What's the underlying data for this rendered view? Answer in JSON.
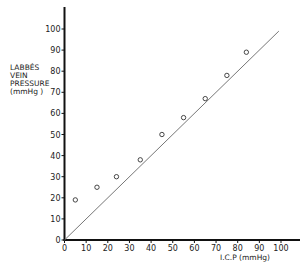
{
  "chart_data": {
    "type": "scatter",
    "title": "",
    "xlabel": "I.C.P (mmHg)",
    "ylabel": "LABBÉS VEIN PRESSURE (mmHg)",
    "ylabel_lines": [
      "LABBÉS",
      "VEIN",
      "PRESSURE",
      "(mmHg )"
    ],
    "xlim": [
      0,
      100
    ],
    "ylim": [
      0,
      100
    ],
    "x_ticks": [
      0,
      10,
      20,
      30,
      40,
      50,
      60,
      70,
      80,
      90,
      100
    ],
    "y_ticks": [
      0,
      10,
      20,
      30,
      40,
      50,
      60,
      70,
      80,
      90,
      100
    ],
    "grid": false,
    "legend": null,
    "series": [
      {
        "name": "measurements",
        "marker": "open-circle",
        "points": [
          {
            "x": 5,
            "y": 19
          },
          {
            "x": 15,
            "y": 25
          },
          {
            "x": 24,
            "y": 30
          },
          {
            "x": 35,
            "y": 38
          },
          {
            "x": 45,
            "y": 50
          },
          {
            "x": 55,
            "y": 58
          },
          {
            "x": 65,
            "y": 67
          },
          {
            "x": 75,
            "y": 78
          },
          {
            "x": 84,
            "y": 89
          }
        ]
      },
      {
        "name": "line of identity",
        "type": "line",
        "points": [
          {
            "x": 0,
            "y": 0
          },
          {
            "x": 99,
            "y": 99
          }
        ]
      }
    ]
  },
  "colors": {
    "axis": "#111111",
    "identity_line": "#777777",
    "marker": "#333333"
  }
}
